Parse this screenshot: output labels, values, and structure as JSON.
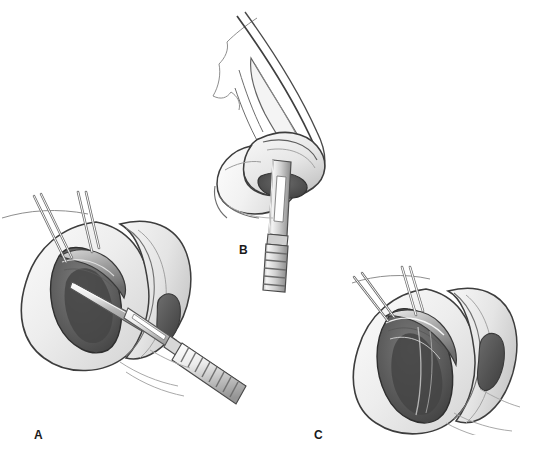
{
  "figure": {
    "background_color": "#ffffff",
    "width": 540,
    "height": 468,
    "style": "grayscale pencil and wash medical illustration",
    "label_color": "#1a1a1a"
  },
  "panels": [
    {
      "id": "A",
      "label": "A",
      "label_x": 34,
      "label_y": 429,
      "view": "worm's-eye view of right nostril",
      "description": "Nostril rim retracted with two double-prong skin hooks while a scalpel incises the caudal margin of the lower lateral cartilage",
      "instruments": [
        "double-prong skin hook",
        "double-prong skin hook",
        "scalpel with no. 15 blade"
      ],
      "anatomy": [
        "ala",
        "nostril sill",
        "columella",
        "lower lateral cartilage",
        "vestibular skin",
        "opposite nostril"
      ]
    },
    {
      "id": "B",
      "label": "B",
      "label_x": 239,
      "label_y": 244,
      "view": "lateral profile view of nose",
      "description": "Profile of the nose with the scalpel blade inserted into the nostril along the caudal border of the lower lateral cartilage",
      "instruments": [
        "scalpel with no. 15 blade"
      ],
      "anatomy": [
        "nasal dorsum",
        "nasal tip",
        "upper lateral cartilage",
        "lower lateral cartilage",
        "ala",
        "nostril",
        "upper lip"
      ]
    },
    {
      "id": "C",
      "label": "C",
      "label_x": 314,
      "label_y": 429,
      "view": "worm's-eye view of right nostril after incision",
      "description": "The completed marginal incision with the nostril rim retracted by two skin hooks exposing the cartilage edge; no scalpel present",
      "instruments": [
        "double-prong skin hook",
        "double-prong skin hook"
      ],
      "anatomy": [
        "ala",
        "marginal incision",
        "lower lateral cartilage",
        "vestibular lining",
        "columella",
        "opposite nostril"
      ]
    }
  ],
  "palette": {
    "outline_dark": "#3a3a3a",
    "outline_mid": "#6e6e6e",
    "skin_light": "#f2f2f2",
    "skin_mid": "#e0e0e0",
    "skin_shadow": "#c4c4c4",
    "cavity_dark": "#4a4a4a",
    "cavity_mid": "#6b6b6b",
    "cavity_deep": "#3c3c3c",
    "metal_light": "#fafafa",
    "metal_mid": "#d2d2d2",
    "metal_dark": "#8a8a8a"
  }
}
